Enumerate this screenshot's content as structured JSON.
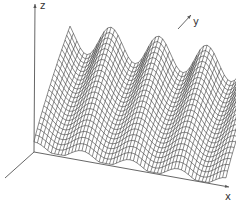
{
  "figure": {
    "type": "3d-wireframe-surface",
    "background": "#ffffff",
    "line_color": "#2a2a2a",
    "axis_color": "#555555"
  },
  "axes": {
    "z": {
      "label": "z"
    },
    "y": {
      "label": "y"
    },
    "x": {
      "label": "x"
    }
  },
  "geometry": {
    "origin": [
      34,
      152
    ],
    "z_axis_top": [
      35,
      4
    ],
    "x_axis_end": [
      229,
      187
    ],
    "neg_y_axis_end": [
      5,
      178
    ],
    "y_axis_start": [
      178,
      29
    ],
    "y_axis_end": [
      191,
      15
    ],
    "z_label_pos": [
      40,
      1
    ],
    "y_label_pos": [
      193,
      17
    ],
    "x_label_pos": [
      225,
      192
    ]
  },
  "surface": {
    "rows": 22,
    "cols": 56,
    "front_left": [
      34,
      150
    ],
    "front_right": [
      226,
      186
    ],
    "back_offset": [
      36,
      -38
    ],
    "wave_periods": 4,
    "wave_phase": 0.0,
    "front_amplitude": 14,
    "back_amplitude": 16,
    "height_front": 8,
    "height_back": 110
  }
}
